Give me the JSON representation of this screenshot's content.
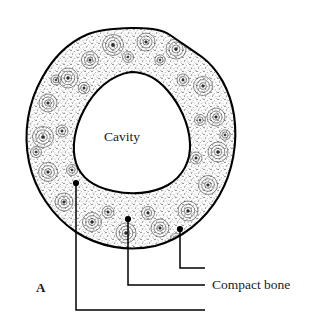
{
  "figure": {
    "panel_letter": "A",
    "colors": {
      "outline": "#000000",
      "stipple": "#2b2b2b",
      "background": "#ffffff",
      "leader_line": "#000000",
      "text": "#1a1a1a"
    }
  },
  "labels": {
    "cavity": "Cavity",
    "compact_bone": "Compact bone"
  },
  "callouts": [
    {
      "name": "inner-cortex-callout",
      "target_x": 76,
      "target_y": 183,
      "text": ""
    },
    {
      "name": "osteon-callout",
      "target_x": 128,
      "target_y": 219,
      "text": ""
    },
    {
      "name": "compact-bone-callout",
      "target_x": 180,
      "target_y": 229,
      "text": "Compact bone"
    }
  ],
  "geometry": {
    "outer_bounds": {
      "left": 27,
      "top": 28,
      "right": 236,
      "bottom": 248
    },
    "cavity_bounds": {
      "left": 75,
      "top": 72,
      "right": 190,
      "bottom": 192
    }
  }
}
